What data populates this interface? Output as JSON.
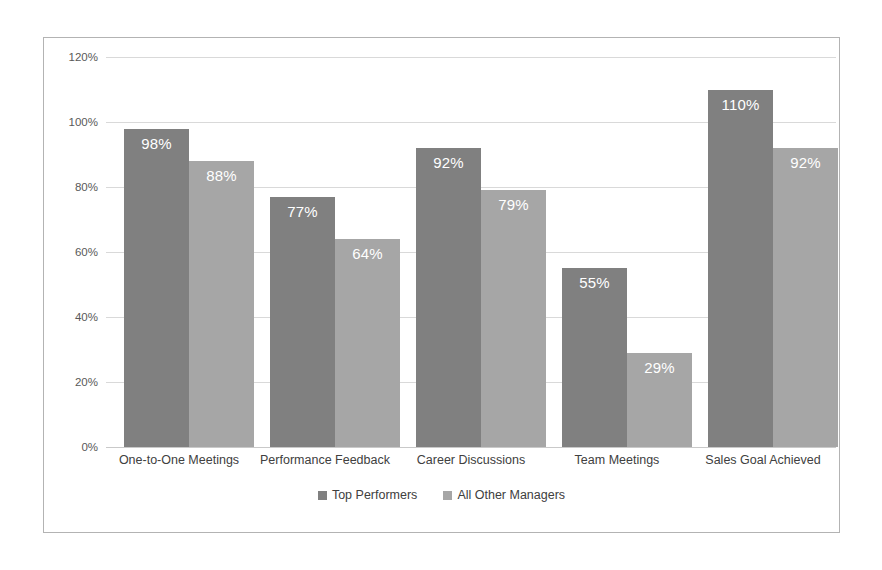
{
  "chart_data": {
    "type": "bar",
    "title": "",
    "subtitle": "",
    "xlabel": "",
    "ylabel": "",
    "categories": [
      "One-to-One Meetings",
      "Performance Feedback",
      "Career Discussions",
      "Team Meetings",
      "Sales Goal Achieved"
    ],
    "series": [
      {
        "name": "Top Performers",
        "color": "#808080",
        "values": [
          98,
          77,
          92,
          55,
          110
        ],
        "value_labels": [
          "98%",
          "77%",
          "92%",
          "55%",
          "110%"
        ]
      },
      {
        "name": "All Other Managers",
        "color": "#a6a6a6",
        "values": [
          88,
          64,
          79,
          29,
          92
        ],
        "value_labels": [
          "88%",
          "64%",
          "79%",
          "29%",
          "92%"
        ]
      }
    ],
    "ylim": [
      0,
      120
    ],
    "ytick_values": [
      0,
      20,
      40,
      60,
      80,
      100,
      120
    ],
    "ytick_labels": [
      "0%",
      "20%",
      "40%",
      "60%",
      "80%",
      "100%",
      "120%"
    ],
    "grid": "horizontal",
    "legend_position": "bottom",
    "value_unit": "%"
  },
  "colors": {
    "series_top": "#808080",
    "series_other": "#a6a6a6",
    "gridline": "#d9d9d9",
    "frame_border": "#b3b3b3",
    "axis_text": "#595959",
    "category_text": "#404040",
    "bar_label_text": "#ffffff",
    "background": "#ffffff"
  }
}
